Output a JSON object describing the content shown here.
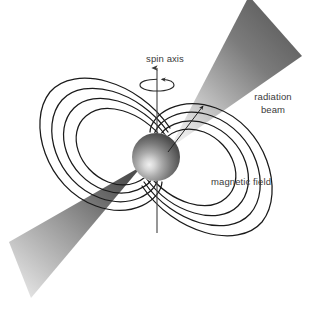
{
  "figure": {
    "background_color": "#ffffff",
    "width": 320,
    "height": 311
  },
  "labels": {
    "spin_axis": "spin axis",
    "radiation_beam_line1": "radiation",
    "radiation_beam_line2": "beam",
    "magnetic_field": "magnetic field"
  },
  "colors": {
    "text": "#3a3a3a",
    "field_line": "#1a1a1a",
    "axis_line": "#4a4a4a",
    "beam_dark": "#5a5a5a",
    "beam_light": "#d8d8d8",
    "star_highlight": "#e8e8e8",
    "star_mid": "#8a8a8a",
    "star_dark": "#3c3c3c"
  },
  "elements": {
    "neutron_star": {
      "name": "neutron-star-sphere",
      "center_x": 156,
      "center_y": 157,
      "radius": 24
    },
    "spin_axis": {
      "name": "spin-axis",
      "x": 157,
      "y_top": 66,
      "y_bottom": 233,
      "arrow_direction": "up"
    },
    "rotation_indicator": {
      "name": "rotation-ellipse",
      "center_x": 157,
      "center_y": 85,
      "rx": 17,
      "ry": 6
    },
    "magnetic_axis": {
      "name": "magnetic-axis",
      "tilt_degrees_from_spin_axis": 38,
      "direction": "upper-right to lower-left"
    },
    "beam_upper": {
      "name": "radiation-beam-upper",
      "apex_x": 170,
      "apex_y": 148,
      "gradient": "light at apex to dark at wide end"
    },
    "beam_lower": {
      "name": "radiation-beam-lower",
      "apex_x": 142,
      "apex_y": 166,
      "gradient": "dark at apex to light at wide end"
    },
    "field_loops": {
      "name": "magnetic-field-loops",
      "loops_per_side": 4,
      "sides": [
        "upper-left",
        "lower-right"
      ]
    }
  }
}
